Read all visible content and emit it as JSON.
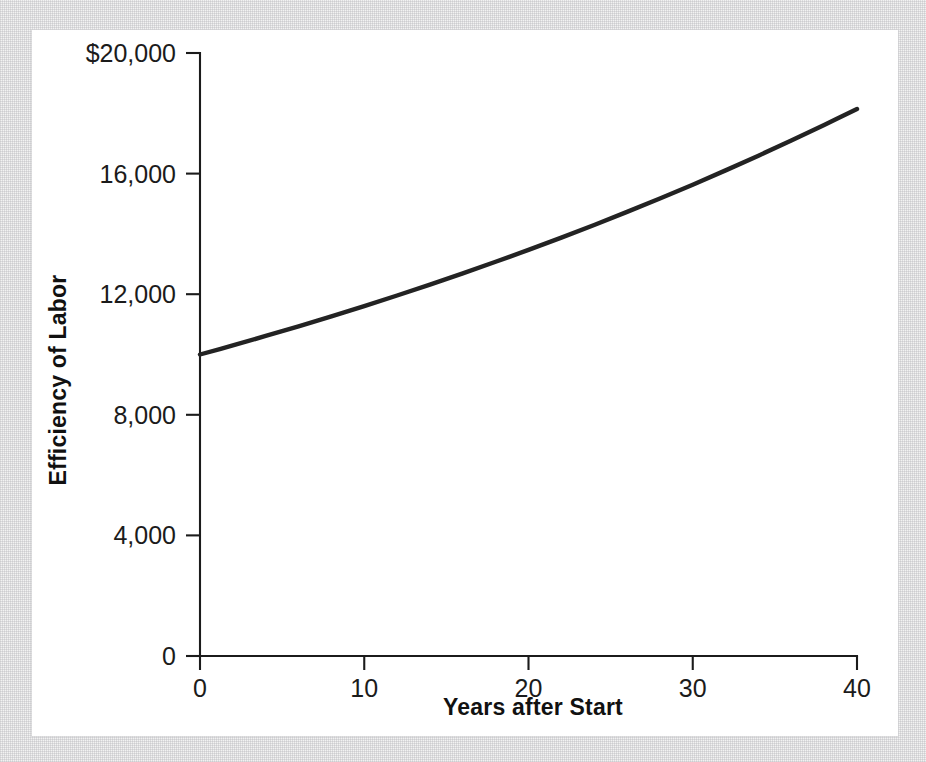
{
  "figure": {
    "background_color": "#f2f2f2",
    "panel_color": "#ffffff",
    "curve_color": "#232323",
    "axis_color": "#1b1b1b"
  },
  "chart_data": {
    "type": "line",
    "title": "",
    "subtitle": "",
    "xlabel": "Years after Start",
    "ylabel": "Efficiency of Labor",
    "xlim": [
      0,
      40
    ],
    "ylim": [
      0,
      20000
    ],
    "grid": false,
    "legend": null,
    "xticks": [
      0,
      10,
      20,
      30,
      40
    ],
    "xticklabels": [
      "0",
      "10",
      "20",
      "30",
      "40"
    ],
    "yticks": [
      0,
      4000,
      8000,
      12000,
      16000,
      20000
    ],
    "yticklabels": [
      "0",
      "4,000",
      "8,000",
      "12,000",
      "16,000",
      "$20,000"
    ],
    "series": [
      {
        "name": "Efficiency of Labor",
        "color": "#232323",
        "x": [
          0,
          2,
          4,
          6,
          8,
          10,
          12,
          14,
          16,
          18,
          20,
          22,
          24,
          26,
          28,
          30,
          32,
          34,
          36,
          38,
          40
        ],
        "values": [
          10000,
          10302,
          10614,
          10934,
          11265,
          11605,
          11956,
          12318,
          12690,
          13075,
          13469,
          13877,
          14297,
          14730,
          15176,
          15631,
          16107,
          16594,
          17098,
          17614,
          18140
        ]
      }
    ],
    "annotations": []
  },
  "axis_titles": {
    "x": "Years after Start",
    "y": "Efficiency of Labor"
  }
}
